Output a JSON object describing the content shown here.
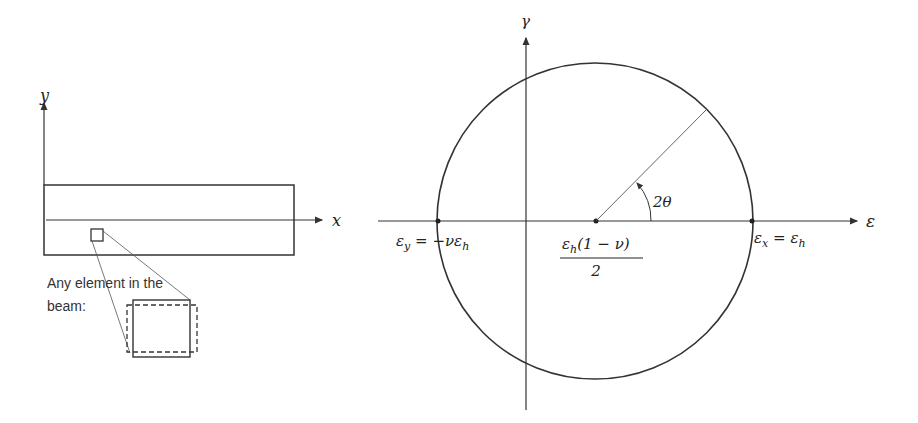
{
  "beam_figure": {
    "y_axis_label": "y",
    "x_axis_label": "x",
    "caption_line1": "Any element in the",
    "caption_line2": "beam:"
  },
  "mohr_circle": {
    "vertical_axis_label": "γ",
    "horizontal_axis_label": "ε",
    "angle_label": "2θ",
    "left_point_label": "εy = −νεh",
    "left_point_parts": {
      "lhs": "ε",
      "lhs_sub": "y",
      "eq": " = −νε",
      "rhs_sub": "h"
    },
    "right_point_label": "εx = εh",
    "right_point_parts": {
      "lhs": "ε",
      "lhs_sub": "x",
      "eq": " = ε",
      "rhs_sub": "h"
    },
    "center_label_numerator": "εh(1 − ν)",
    "center_numerator_parts": {
      "a": "ε",
      "sub": "h",
      "b": "(1 − ν)"
    },
    "center_label_denominator": "2"
  },
  "colors": {
    "line": "#333333",
    "text": "#222222",
    "background": "#ffffff"
  }
}
